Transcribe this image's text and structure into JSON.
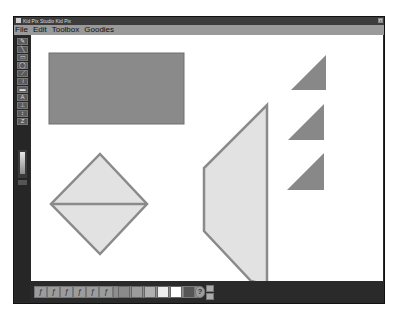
{
  "window": {
    "title": "Kid Pix Studio Kid Pix",
    "close_label": "x"
  },
  "menu": {
    "items": [
      {
        "label": "File"
      },
      {
        "label": "Edit"
      },
      {
        "label": "Toolbox"
      },
      {
        "label": "Goodies"
      }
    ]
  },
  "toolbox": {
    "tools": [
      {
        "name": "pencil-tool",
        "glyph": "✎"
      },
      {
        "name": "line-tool",
        "glyph": "╲"
      },
      {
        "name": "rectangle-tool",
        "glyph": "▭"
      },
      {
        "name": "oval-tool",
        "glyph": "◯"
      },
      {
        "name": "paint-can-tool",
        "glyph": "⟋"
      },
      {
        "name": "wacky-brush-tool",
        "glyph": "≀"
      },
      {
        "name": "eraser-tool",
        "glyph": "▬"
      },
      {
        "name": "text-tool",
        "glyph": "A"
      },
      {
        "name": "stamp-tool",
        "glyph": "⊥"
      },
      {
        "name": "move-tool",
        "glyph": "↕"
      },
      {
        "name": "undo-tool",
        "glyph": "Z"
      }
    ]
  },
  "palette": {
    "options": [
      "ƒ",
      "ƒ",
      "ƒ",
      "ƒ",
      "ƒ",
      "ƒ"
    ],
    "swatches": [
      "#8a8a8a",
      "#9c9c9c",
      "#b0b0b0",
      "#ececec",
      "#ffffff"
    ],
    "help_label": "?"
  },
  "canvas": {
    "colors": {
      "rect_fill": "#8a8a8a",
      "shape_fill": "#e2e2e2",
      "shape_stroke": "#8a8a8a",
      "triangle_fill": "#888888"
    }
  }
}
